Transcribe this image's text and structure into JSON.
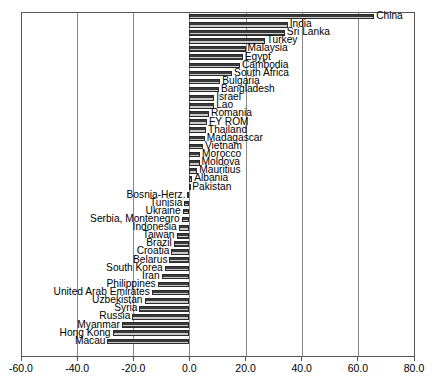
{
  "chart_data": {
    "type": "bar",
    "orientation": "horizontal",
    "title": "",
    "subtitle": "",
    "xlabel": "",
    "ylabel": "",
    "xlim": [
      -60.0,
      80.0
    ],
    "grid": true,
    "legend": "none",
    "xticks": [
      "-60.0",
      "-40.0",
      "-20.0",
      "0.0",
      "20.0",
      "40.0",
      "60.0",
      "80.0"
    ],
    "xtick_values": [
      -60,
      -40,
      -20,
      0,
      20,
      40,
      60,
      80
    ],
    "categories": [
      "China",
      "India",
      "Sri Lanka",
      "Turkey",
      "Malaysia",
      "Egypt",
      "Cambodia",
      "South Africa",
      "Bulgaria",
      "Bangladesh",
      "Israel",
      "Lao",
      "Romania",
      "FY ROM",
      "Thailand",
      "Madagascar",
      "Vietnam",
      "Morocco",
      "Moldova",
      "Mauritius",
      "Albania",
      "Pakistan",
      "Bosnia-Herz.",
      "Tunisia",
      "Ukraine",
      "Serbia, Montenegro",
      "Indonesia",
      "Taiwan",
      "Brazil",
      "Croatia",
      "Belarus",
      "South Korea",
      "Iran",
      "Philippines",
      "United Arab Emirates",
      "Uzbekistan",
      "Syria",
      "Russia",
      "Myanmar",
      "Hong Kong",
      "Macau"
    ],
    "values": [
      65.8,
      35.0,
      34.0,
      26.8,
      20.0,
      19.0,
      18.0,
      15.2,
      11.0,
      10.5,
      8.8,
      8.8,
      7.0,
      6.3,
      5.9,
      5.5,
      4.8,
      3.8,
      3.6,
      2.8,
      1.0,
      0.3,
      -0.7,
      -1.8,
      -2.4,
      -2.8,
      -3.8,
      -4.6,
      -5.6,
      -6.4,
      -7.1,
      -8.8,
      -9.9,
      -11.3,
      -13.4,
      -16.0,
      -17.8,
      -20.3,
      -24.1,
      -27.4,
      -29.2
    ]
  }
}
